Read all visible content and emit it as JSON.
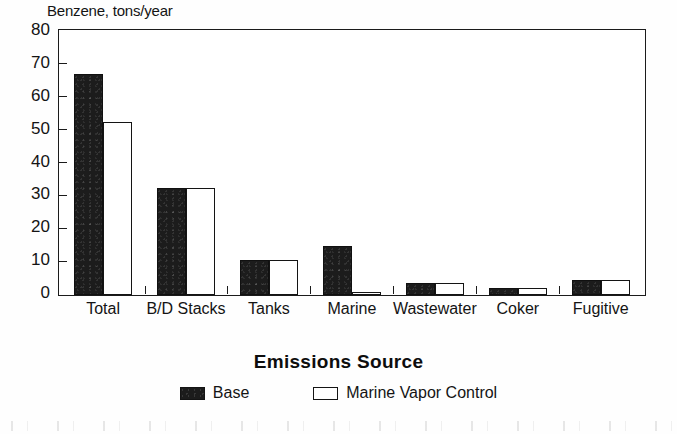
{
  "chart_data": {
    "type": "bar",
    "title": "",
    "ylabel": "Benzene, tons/year",
    "xlabel": "Emissions Source",
    "categories": [
      "Total",
      "B/D Stacks",
      "Tanks",
      "Marine",
      "Wastewater",
      "Coker",
      "Fugitive"
    ],
    "series": [
      {
        "name": "Base",
        "values": [
          67,
          32.5,
          10.5,
          15,
          3.5,
          2,
          4.5
        ],
        "color": "#1c1c1c",
        "style": "filled"
      },
      {
        "name": "Marine Vapor Control",
        "values": [
          52.5,
          32.5,
          10.5,
          0.5,
          3.5,
          2,
          4.5
        ],
        "color": "#ffffff",
        "style": "outline"
      }
    ],
    "ylim": [
      0,
      80
    ],
    "yticks": [
      0,
      10,
      20,
      30,
      40,
      50,
      60,
      70,
      80
    ],
    "ytick_labels": [
      "0",
      "10",
      "20",
      "30",
      "40",
      "50",
      "60",
      "70",
      "80"
    ],
    "grid": false,
    "legend_position": "bottom"
  },
  "axes": {
    "y_title": "Benzene, tons/year",
    "x_title": "Emissions Source"
  },
  "legend": {
    "items": [
      {
        "label": "Base",
        "swatch": "filled-black-square"
      },
      {
        "label": "Marine Vapor Control",
        "swatch": "outline-white-square"
      }
    ]
  },
  "colors": {
    "base_fill": "#1c1c1c",
    "control_fill": "#ffffff",
    "axis": "#1b1b1b",
    "text": "#141414",
    "background": "#ffffff"
  }
}
